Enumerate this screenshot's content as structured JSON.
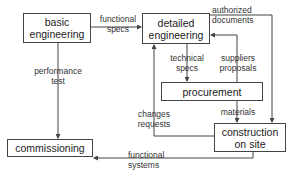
{
  "nodes": {
    "basic_engineering": "basic\nengineering",
    "detailed_engineering": "detailed\nengineering",
    "procurement": "procurement",
    "construction": "construction\non site",
    "commissioning": "commissioning"
  },
  "edges": {
    "functional_specs": "functional\nspecs",
    "authorized_documents": "authorized\ndocuments",
    "performance_test": "performance\ntest",
    "technical_specs": "technical\nspecs",
    "suppliers_proposals": "suppliers\nproposals",
    "changes_requests": "changes\nrequests",
    "materials": "materials",
    "functional_systems": "functional\nsystems"
  },
  "colors": {
    "line": "#444444",
    "text": "#222222"
  }
}
